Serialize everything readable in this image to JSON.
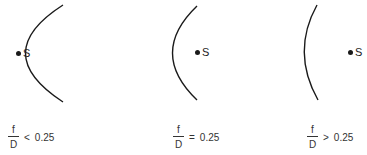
{
  "diagram": {
    "stroke_color": "#1a1a1a",
    "panels": [
      {
        "id": "f-over-d-less",
        "curve": "M63,5 Q-12,53 63,102",
        "source": {
          "label": "S",
          "dot_x": 16,
          "dot_y": 51,
          "label_x": 23,
          "label_y": 48
        },
        "ratio": {
          "numerator": "f",
          "denominator": "D",
          "operator": "<",
          "value": "0.25",
          "x": 8,
          "y": 124
        }
      },
      {
        "id": "f-over-d-equal",
        "curve": "M197,6 Q148,53 197,100",
        "source": {
          "label": "S",
          "dot_x": 195,
          "dot_y": 50,
          "label_x": 202,
          "label_y": 47
        },
        "ratio": {
          "numerator": "f",
          "denominator": "D",
          "operator": "=",
          "value": "0.25",
          "x": 173,
          "y": 124
        }
      },
      {
        "id": "f-over-d-greater",
        "curve": "M317,5 Q291,52 318,100",
        "source": {
          "label": "S",
          "dot_x": 348,
          "dot_y": 50,
          "label_x": 355,
          "label_y": 47
        },
        "ratio": {
          "numerator": "f",
          "denominator": "D",
          "operator": ">",
          "value": "0.25",
          "x": 307,
          "y": 124
        }
      }
    ]
  }
}
